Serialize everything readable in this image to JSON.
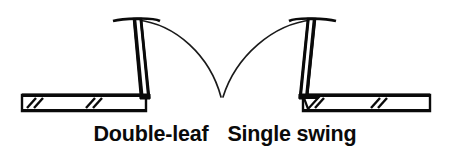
{
  "figure": {
    "kind": "architectural-plan-symbol",
    "background_color": "#ffffff",
    "ink_color": "#0a0a0a"
  },
  "captions": {
    "left_label": "Double-leaf",
    "right_label": "Single swing"
  },
  "diagram": {
    "walls": [
      {
        "name": "left-wall",
        "x_start": 22,
        "x_end": 146,
        "y_top": 95,
        "y_bottom": 111,
        "break_marks": 2
      },
      {
        "name": "right-wall",
        "x_start": 303,
        "x_end": 430,
        "y_top": 95,
        "y_bottom": 111,
        "break_marks": 2
      }
    ],
    "door_leaves": [
      {
        "name": "left-door-leaf",
        "hinge_x": 145,
        "hinge_y": 96,
        "tip_x": 137,
        "tip_y": 19,
        "cap_half_width": 22,
        "open_direction": "right"
      },
      {
        "name": "right-door-leaf",
        "hinge_x": 303,
        "hinge_y": 96,
        "tip_x": 312,
        "tip_y": 19,
        "cap_half_width": 22,
        "open_direction": "left"
      }
    ],
    "swing_arcs": [
      {
        "name": "left-swing-arc",
        "from_x": 137,
        "from_y": 19,
        "to_x": 222,
        "to_y": 98,
        "radius": 80
      },
      {
        "name": "right-swing-arc",
        "from_x": 312,
        "from_y": 19,
        "to_x": 222,
        "to_y": 98,
        "radius": 80
      }
    ],
    "meeting_point": {
      "name": "arc-meeting-point",
      "x": 222,
      "y": 98
    }
  }
}
